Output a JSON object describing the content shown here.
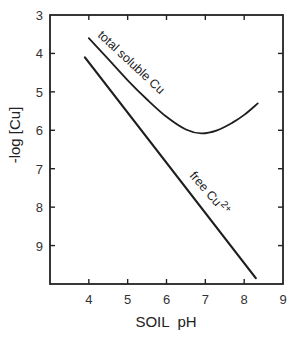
{
  "chart_data": {
    "type": "line",
    "title": "",
    "xlabel": "SOIL  pH",
    "ylabel": "-log [Cu]",
    "xlim": [
      3,
      9
    ],
    "ylim": [
      10,
      3
    ],
    "y_inverted": true,
    "grid": false,
    "legend": "inline curve labels",
    "x_ticks": [
      "4",
      "5",
      "6",
      "7",
      "8",
      "9"
    ],
    "y_ticks": [
      "3",
      "4",
      "5",
      "6",
      "7",
      "8",
      "9"
    ],
    "series": [
      {
        "name": "total soluble Cu",
        "label": "total soluble Cu",
        "x": [
          4.0,
          4.5,
          5.0,
          5.5,
          6.0,
          6.5,
          6.9,
          7.3,
          7.7,
          8.0,
          8.35
        ],
        "y": [
          3.6,
          4.15,
          4.7,
          5.2,
          5.65,
          5.98,
          6.08,
          6.0,
          5.8,
          5.6,
          5.3
        ]
      },
      {
        "name": "free Cu2+",
        "label": "free Cu",
        "label_superscript": "2+",
        "x": [
          3.9,
          8.3
        ],
        "y": [
          4.1,
          9.85
        ]
      }
    ]
  }
}
